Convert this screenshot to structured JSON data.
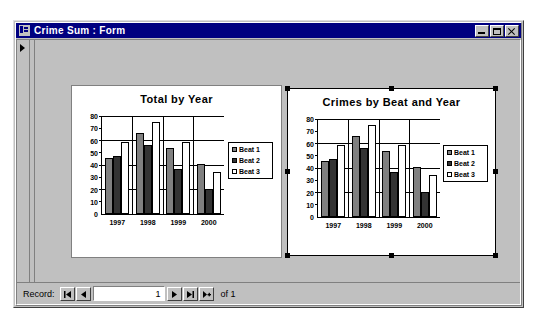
{
  "window": {
    "title": "Crime Sum : Form",
    "icon": "access-form-icon",
    "buttons": {
      "minimize": "minimize-button",
      "maximize": "maximize-button",
      "close": "close-button"
    }
  },
  "charts": [
    {
      "id": "chart1",
      "selected": false,
      "chart_data": {
        "type": "bar",
        "title": "Total by Year",
        "categories": [
          "1997",
          "1998",
          "1999",
          "2000"
        ],
        "series": [
          {
            "name": "Beat 1",
            "color": "#808080",
            "values": [
              46,
              66,
              54,
              41
            ]
          },
          {
            "name": "Beat 2",
            "color": "#333333",
            "values": [
              47,
              56,
              37,
              20
            ]
          },
          {
            "name": "Beat 3",
            "color": "#ffffff",
            "values": [
              59,
              75,
              59,
              34
            ]
          }
        ],
        "xlabel": "",
        "ylabel": "",
        "ylim": [
          0,
          80
        ],
        "yticks": [
          0,
          10,
          20,
          30,
          40,
          50,
          60,
          70,
          80
        ],
        "grid": true,
        "legend_position": "right"
      }
    },
    {
      "id": "chart2",
      "selected": true,
      "chart_data": {
        "type": "bar",
        "title": "Crimes by Beat and Year",
        "categories": [
          "1997",
          "1998",
          "1999",
          "2000"
        ],
        "series": [
          {
            "name": "Beat 1",
            "color": "#808080",
            "values": [
              46,
              66,
              54,
              41
            ]
          },
          {
            "name": "Beat 2",
            "color": "#333333",
            "values": [
              47,
              56,
              37,
              20
            ]
          },
          {
            "name": "Beat 3",
            "color": "#ffffff",
            "values": [
              59,
              75,
              59,
              34
            ]
          }
        ],
        "xlabel": "",
        "ylabel": "",
        "ylim": [
          0,
          80
        ],
        "yticks": [
          0,
          10,
          20,
          30,
          40,
          50,
          60,
          70,
          80
        ],
        "grid": true,
        "legend_position": "right"
      }
    }
  ],
  "chart_data": [
    {
      "type": "bar",
      "title": "Total by Year",
      "categories": [
        "1997",
        "1998",
        "1999",
        "2000"
      ],
      "series": [
        {
          "name": "Beat 1",
          "values": [
            46,
            66,
            54,
            41
          ]
        },
        {
          "name": "Beat 2",
          "values": [
            47,
            56,
            37,
            20
          ]
        },
        {
          "name": "Beat 3",
          "values": [
            59,
            75,
            59,
            34
          ]
        }
      ],
      "xlabel": "",
      "ylabel": "",
      "ylim": [
        0,
        80
      ],
      "grid": true,
      "legend_position": "right"
    },
    {
      "type": "bar",
      "title": "Crimes by Beat and Year",
      "categories": [
        "1997",
        "1998",
        "1999",
        "2000"
      ],
      "series": [
        {
          "name": "Beat 1",
          "values": [
            46,
            66,
            54,
            41
          ]
        },
        {
          "name": "Beat 2",
          "values": [
            47,
            56,
            37,
            20
          ]
        },
        {
          "name": "Beat 3",
          "values": [
            59,
            75,
            59,
            34
          ]
        }
      ],
      "xlabel": "",
      "ylabel": "",
      "ylim": [
        0,
        80
      ],
      "grid": true,
      "legend_position": "right"
    }
  ],
  "navigation": {
    "label": "Record:",
    "first_button": "go-to-first-record",
    "previous_button": "go-to-previous-record",
    "current_record": "1",
    "next_button": "go-to-next-record",
    "last_button": "go-to-last-record",
    "new_button": "new-record",
    "of_text": "of 1"
  }
}
